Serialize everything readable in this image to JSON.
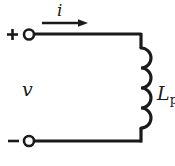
{
  "diagram": {
    "background_color": "#ffffff",
    "ink_color": "#1a1a1a",
    "labels": {
      "current": "i",
      "voltage": "v",
      "inductor_symbol": "L",
      "inductor_subscript": "p",
      "terminal_positive": "+",
      "terminal_negative": "–"
    },
    "elements": {
      "current_arrow": "current-direction-arrow",
      "inductor": "inductor-coil",
      "top_wire": "top-conductor",
      "bottom_wire": "bottom-conductor",
      "right_wire": "right-conductor",
      "positive_terminal": "open-terminal-node",
      "negative_terminal": "open-terminal-node"
    },
    "geometry": {
      "width": 175,
      "height": 166,
      "top_rail_y": 34,
      "bottom_rail_y": 141,
      "right_rail_x": 141,
      "terminal_x": 29,
      "terminal_radius": 5,
      "coil_turns": 4,
      "coil_top_y": 48,
      "coil_bottom_y": 128,
      "arrow_x_start": 42,
      "arrow_x_end": 88,
      "arrow_y": 23
    }
  }
}
